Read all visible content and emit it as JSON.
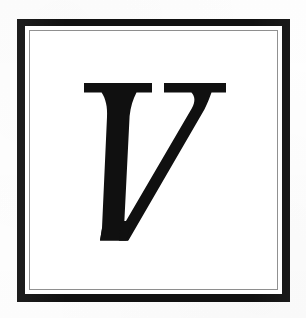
{
  "document": {
    "kind": "framed-initial",
    "width": 306,
    "height": 318,
    "background_color": "#fefefe"
  },
  "frame": {
    "outer_rule": {
      "name": "outer-black-rule",
      "color": "#111111",
      "thickness_px": 8,
      "inset_left_px": 17,
      "inset_top_px": 19,
      "width_px": 273,
      "height_px": 283
    },
    "gap": {
      "name": "white-gap",
      "color": "#ffffff",
      "thickness_px": 4
    },
    "inner_rule": {
      "name": "inner-grey-hairline",
      "color": "#8e8e8e",
      "thickness_px": 1
    },
    "field": {
      "name": "interior-field",
      "color": "#ffffff"
    }
  },
  "initial": {
    "character": "V",
    "label": "V",
    "style": "italic serif capital",
    "ink_color": "#101010",
    "bounds": {
      "left_px": 91,
      "top_px": 88,
      "right_px": 222,
      "bottom_px": 228
    }
  }
}
